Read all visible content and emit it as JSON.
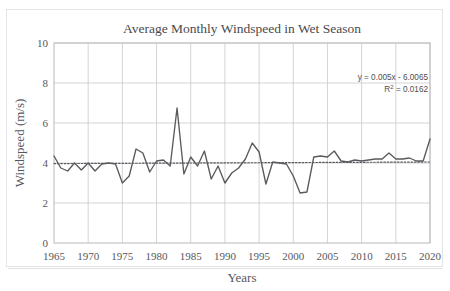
{
  "chart_data": {
    "type": "line",
    "title": "Average Monthly Windspeed in Wet Season",
    "xlabel": "Years",
    "ylabel": "Windspeed (m/s)",
    "xlim": [
      1965,
      2020
    ],
    "ylim": [
      0,
      10
    ],
    "grid": true,
    "legend": "none",
    "x_ticks": [
      "1965",
      "1970",
      "1975",
      "1980",
      "1985",
      "1990",
      "1995",
      "2000",
      "2005",
      "2010",
      "2015",
      "2020"
    ],
    "x_tick_values": [
      1965,
      1970,
      1975,
      1980,
      1985,
      1990,
      1995,
      2000,
      2005,
      2010,
      2015,
      2020
    ],
    "y_ticks": [
      "0",
      "2",
      "4",
      "6",
      "8",
      "10"
    ],
    "y_tick_values": [
      0,
      2,
      4,
      6,
      8,
      10
    ],
    "series": [
      {
        "name": "Average monthly windspeed",
        "kind": "line",
        "color": "#5a5a5e",
        "x": [
          1965,
          1966,
          1967,
          1968,
          1969,
          1970,
          1971,
          1972,
          1973,
          1974,
          1975,
          1976,
          1977,
          1978,
          1979,
          1980,
          1981,
          1982,
          1983,
          1984,
          1985,
          1986,
          1987,
          1988,
          1989,
          1990,
          1991,
          1992,
          1993,
          1994,
          1995,
          1996,
          1997,
          1998,
          1999,
          2000,
          2001,
          2002,
          2003,
          2004,
          2005,
          2006,
          2007,
          2008,
          2009,
          2010,
          2011,
          2012,
          2013,
          2014,
          2015,
          2016,
          2017,
          2018,
          2019,
          2020
        ],
        "values": [
          4.35,
          3.75,
          3.6,
          4.0,
          3.65,
          4.0,
          3.6,
          3.95,
          4.0,
          3.95,
          3.0,
          3.35,
          4.7,
          4.5,
          3.55,
          4.1,
          4.15,
          3.85,
          6.75,
          3.45,
          4.3,
          3.85,
          4.6,
          3.2,
          3.85,
          3.0,
          3.5,
          3.75,
          4.2,
          5.0,
          4.55,
          2.95,
          4.05,
          4.0,
          3.95,
          3.35,
          2.5,
          2.55,
          4.3,
          4.35,
          4.3,
          4.6,
          4.1,
          4.05,
          4.15,
          4.1,
          4.15,
          4.2,
          4.2,
          4.5,
          4.2,
          4.2,
          4.25,
          4.1,
          4.1,
          5.2
        ]
      },
      {
        "name": "Linear trendline",
        "kind": "dotted-trendline",
        "color": "#5a5a5e",
        "x": [
          1965,
          2020
        ],
        "values": [
          3.97,
          4.05
        ]
      }
    ],
    "annotations": [
      {
        "name": "trendline-equation",
        "text": "y = 0.005x - 6.0065"
      },
      {
        "name": "trendline-r-squared",
        "text": "R",
        "sup": "2",
        "tail": " = 0.0162"
      }
    ]
  }
}
